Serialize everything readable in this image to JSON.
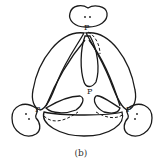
{
  "figure": {
    "caption": "(b)",
    "atom_label": "P",
    "atoms": [
      {
        "id": "top",
        "label": "P"
      },
      {
        "id": "center",
        "label": "P"
      },
      {
        "id": "left",
        "label": "P"
      },
      {
        "id": "right",
        "label": "P"
      }
    ],
    "lone_pair_symbol": ":",
    "stroke_color": "#1a1a1a",
    "background": "#ffffff"
  }
}
